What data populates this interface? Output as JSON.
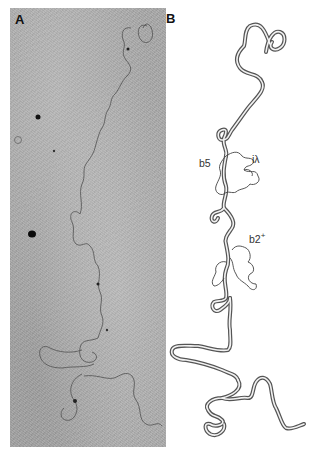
{
  "figure": {
    "panels": [
      {
        "id": "A",
        "label": "A",
        "type": "electron-micrograph",
        "description": "Heteroduplex DNA molecule electron micrograph"
      },
      {
        "id": "B",
        "label": "B",
        "type": "tracing",
        "description": "Interpretive tracing of molecule in panel A"
      }
    ],
    "annotations": {
      "b5": "b5",
      "i_lambda": "iλ",
      "b2_base": "b2",
      "b2_sup": "+"
    },
    "colors": {
      "micrograph_bg": "#a9a9a9",
      "strand_dark": "#555555",
      "tracing_stroke": "#666666",
      "tracing_inner": "#ffffff"
    }
  }
}
